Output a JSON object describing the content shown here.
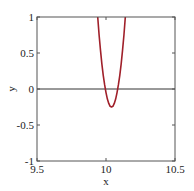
{
  "chart_data": {
    "type": "line",
    "title": "",
    "xlabel": "x",
    "ylabel": "y",
    "xlim": [
      9.5,
      10.5
    ],
    "ylim": [
      -1,
      1
    ],
    "grid": false,
    "legend": null,
    "xticks": [
      9.5,
      10,
      10.5
    ],
    "xtick_labels": [
      "9.5",
      "10",
      "10.5"
    ],
    "yticks": [
      -1,
      -0.5,
      0,
      0.5,
      1
    ],
    "ytick_labels": [
      "-1",
      "-0.5",
      "0",
      "0.5",
      "1"
    ],
    "reference_lines": [
      {
        "orientation": "horizontal",
        "y": 0,
        "color": "#333333"
      }
    ],
    "series": [
      {
        "name": "curve",
        "color": "#a0202a",
        "x": [
          9.93,
          9.94,
          9.95,
          9.96,
          9.97,
          9.98,
          9.99,
          10.0,
          10.01,
          10.02,
          10.03,
          10.04,
          10.05,
          10.06,
          10.07,
          10.08,
          10.09,
          10.1,
          10.11,
          10.12,
          10.13,
          10.14,
          10.15,
          10.16
        ],
        "y": [
          1.24,
          1.0,
          0.75,
          0.54,
          0.35,
          0.19,
          0.06,
          -0.05,
          -0.14,
          -0.2,
          -0.24,
          -0.25,
          -0.24,
          -0.2,
          -0.14,
          -0.05,
          0.06,
          0.19,
          0.35,
          0.54,
          0.75,
          1.0,
          1.24,
          1.24
        ]
      }
    ],
    "annotations": []
  }
}
